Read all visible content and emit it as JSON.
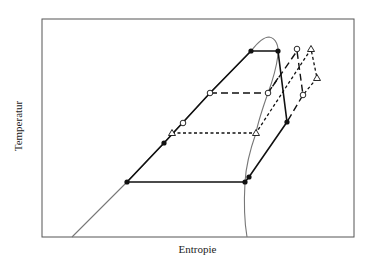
{
  "diagram": {
    "type": "T-s diagram (thermodynamic cycle)",
    "xlabel": "Entropie",
    "ylabel": "Temperatur",
    "colors": {
      "frame": "#555555",
      "dome": "#777777",
      "cycle": "#111111",
      "marker_fill_open": "#ffffff"
    },
    "cycles": [
      {
        "name": "main-cycle",
        "style": "solid"
      },
      {
        "name": "dashed-cycle",
        "style": "dashed"
      },
      {
        "name": "dotted-cycle",
        "style": "dotted"
      }
    ],
    "marker_types": [
      "solid-dot",
      "open-circle",
      "open-triangle"
    ]
  }
}
